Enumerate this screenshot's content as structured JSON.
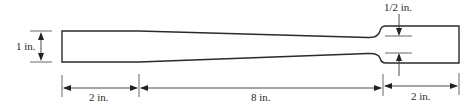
{
  "figure": {
    "type": "tapered tensile specimen / bar drawing",
    "colors": {
      "line": "#2b2b2b",
      "background": "#ffffff"
    },
    "dimensions": {
      "height_left": "1 in.",
      "neck_width": "1/2 in.",
      "left_grip_length": "2 in.",
      "taper_length": "8 in.",
      "right_grip_length": "2 in."
    }
  }
}
